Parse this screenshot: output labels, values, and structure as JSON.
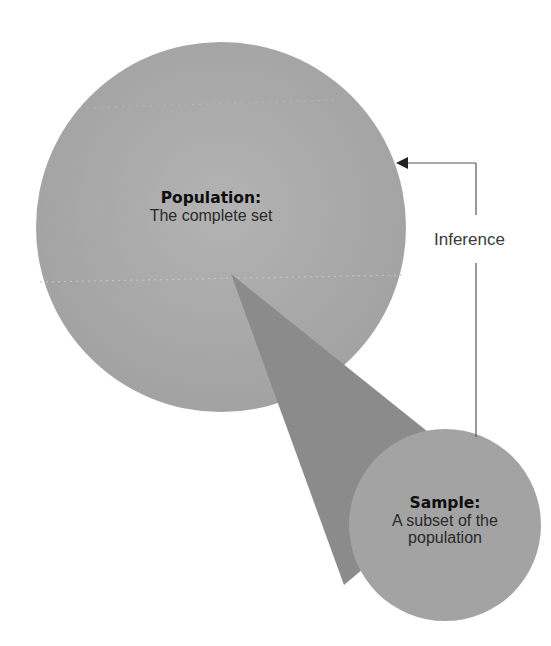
{
  "diagram": {
    "population": {
      "title": "Population:",
      "description": "The complete set"
    },
    "sample": {
      "title": "Sample:",
      "description_line1": "A subset of the",
      "description_line2": "population"
    },
    "inference": {
      "label": "Inference"
    },
    "colors": {
      "population_circle": "#a6a6a6",
      "sample_circle": "#a2a2a2",
      "cone": "#8a8a8a",
      "arrow": "#444444",
      "background": "#ffffff"
    }
  }
}
